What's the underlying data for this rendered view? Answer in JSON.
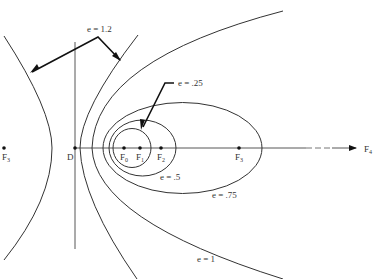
{
  "diagram": {
    "colors": {
      "stroke": "#333333",
      "background": "#ffffff"
    },
    "directrix": {
      "label": "D"
    },
    "axis": {
      "end_label": "F",
      "end_label_sub": "4"
    },
    "foci": [
      {
        "label": "F",
        "sub": "0"
      },
      {
        "label": "F",
        "sub": "1"
      },
      {
        "label": "F",
        "sub": "2"
      },
      {
        "label": "F",
        "sub": "3"
      },
      {
        "label": "F",
        "sub": "3",
        "side": "left"
      }
    ],
    "curves": [
      {
        "eccentricity_label": "e = .25",
        "type": "ellipse"
      },
      {
        "eccentricity_label": "e = .5",
        "type": "ellipse"
      },
      {
        "eccentricity_label": "e = .75",
        "type": "ellipse"
      },
      {
        "eccentricity_label": "e = 1",
        "type": "parabola"
      },
      {
        "eccentricity_label": "e = 1.2",
        "type": "hyperbola"
      }
    ]
  }
}
